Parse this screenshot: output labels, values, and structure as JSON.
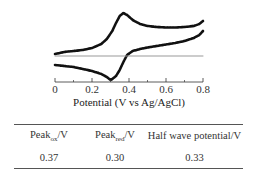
{
  "chart_data": {
    "type": "line",
    "title": "",
    "xlabel": "Potential (V vs Ag/AgCl)",
    "ylabel": "",
    "xlim": [
      0,
      0.8
    ],
    "xticks": [
      0,
      0.2,
      0.4,
      0.6,
      0.8
    ],
    "xtick_labels": [
      "0",
      "0.2",
      "0.4",
      "0.6",
      "0.8"
    ],
    "grid": false,
    "legend": null,
    "y_units": "relative current (arbitrary, zero at gray baseline)",
    "series": [
      {
        "name": "Anodic (forward) scan",
        "x": [
          0.0,
          0.05,
          0.1,
          0.15,
          0.2,
          0.25,
          0.28,
          0.31,
          0.33,
          0.35,
          0.37,
          0.39,
          0.42,
          0.46,
          0.5,
          0.55,
          0.6,
          0.65,
          0.7,
          0.75,
          0.78,
          0.8
        ],
        "y": [
          2,
          4,
          5,
          6,
          8,
          12,
          17,
          25,
          33,
          40,
          43,
          41,
          36,
          32,
          30,
          29,
          28.5,
          28.5,
          29,
          30,
          32,
          35
        ]
      },
      {
        "name": "Cathodic (reverse) scan",
        "x": [
          0.8,
          0.78,
          0.75,
          0.7,
          0.65,
          0.6,
          0.55,
          0.5,
          0.46,
          0.42,
          0.39,
          0.37,
          0.35,
          0.33,
          0.31,
          0.3,
          0.28,
          0.25,
          0.2,
          0.15,
          0.1,
          0.05,
          0.0
        ],
        "y": [
          25,
          21,
          18,
          15,
          13,
          11.5,
          10,
          8.5,
          7,
          5,
          1,
          -6,
          -14,
          -20,
          -23,
          -24,
          -21,
          -18,
          -15,
          -13,
          -11,
          -10,
          -9
        ]
      },
      {
        "name": "Baseline (blank)",
        "x": [
          0.0,
          0.8
        ],
        "y": [
          0,
          0
        ]
      }
    ],
    "colors": {
      "cv": "#111111",
      "baseline": "#999999"
    }
  },
  "table": {
    "headers": [
      {
        "main": "Peak",
        "sub": "ox",
        "suffix": "/V"
      },
      {
        "main": "Peak",
        "sub": "red",
        "suffix": "/V"
      },
      {
        "main": "Half wave potential/V",
        "sub": "",
        "suffix": ""
      }
    ],
    "rows": [
      [
        "0.37",
        "0.30",
        "0.33"
      ]
    ]
  }
}
